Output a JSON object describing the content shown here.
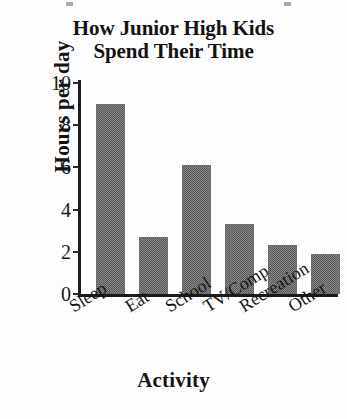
{
  "chart_data": {
    "type": "bar",
    "title": "How Junior High Kids Spend Their Time",
    "title_lines": [
      "How Junior High Kids",
      "Spend Their Time"
    ],
    "xlabel": "Activity",
    "ylabel": "Hours per day",
    "categories": [
      "Sleep",
      "Eat",
      "School",
      "TV/Comp",
      "Recreation",
      "Other"
    ],
    "values": [
      9.0,
      2.7,
      6.1,
      3.3,
      2.3,
      1.9
    ],
    "ylim": [
      0,
      10
    ],
    "yticks": [
      0,
      2,
      4,
      6,
      8,
      10
    ],
    "ytick_labels": [
      "0",
      "2",
      "4",
      "6",
      "8",
      "10"
    ],
    "grid": false,
    "legend": false,
    "bar_color": "#808080",
    "axis_color": "#1b1b1b",
    "background": "#fdfdfd",
    "xtick_rotation_deg": -32
  }
}
